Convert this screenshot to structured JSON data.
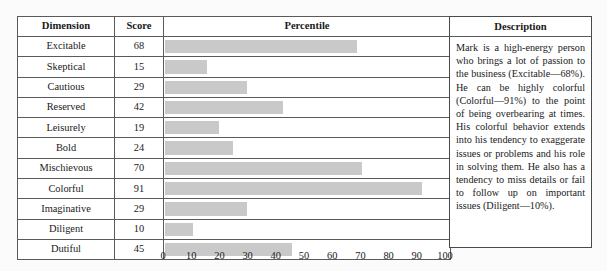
{
  "table": {
    "headers": {
      "dimension": "Dimension",
      "score": "Score",
      "percentile": "Percentile",
      "description": "Description"
    },
    "rows": [
      {
        "dimension": "Excitable",
        "score": 68
      },
      {
        "dimension": "Skeptical",
        "score": 15
      },
      {
        "dimension": "Cautious",
        "score": 29
      },
      {
        "dimension": "Reserved",
        "score": 42
      },
      {
        "dimension": "Leisurely",
        "score": 19
      },
      {
        "dimension": "Bold",
        "score": 24
      },
      {
        "dimension": "Mischievous",
        "score": 70
      },
      {
        "dimension": "Colorful",
        "score": 91
      },
      {
        "dimension": "Imaginative",
        "score": 29
      },
      {
        "dimension": "Diligent",
        "score": 10
      },
      {
        "dimension": "Dutiful",
        "score": 45
      }
    ]
  },
  "description": {
    "text": "Mark is a high-energy person who brings a lot of passion to the business (Excitable—68%). He can be highly colorful (Colorful—91%) to the point of being overbearing at times. His colorful behavior extends into his tendency to exaggerate issues or problems and his role in solving them. He also has a tendency to miss details or fail to follow up on important issues (Diligent—10%)."
  },
  "axis": {
    "ticks": [
      "0",
      "10",
      "20",
      "30",
      "40",
      "50",
      "60",
      "70",
      "80",
      "90",
      "100"
    ],
    "min": 0,
    "max": 100
  },
  "colors": {
    "bar": "#c9c9c9",
    "border": "#4a4a4a",
    "background": "#fbfbfb"
  },
  "chart_data": {
    "type": "bar",
    "orientation": "horizontal",
    "title": "",
    "xlabel": "Percentile",
    "ylabel": "Dimension",
    "categories": [
      "Excitable",
      "Skeptical",
      "Cautious",
      "Reserved",
      "Leisurely",
      "Bold",
      "Mischievous",
      "Colorful",
      "Imaginative",
      "Diligent",
      "Dutiful"
    ],
    "values": [
      68,
      15,
      29,
      42,
      19,
      24,
      70,
      91,
      29,
      10,
      45
    ],
    "xlim": [
      0,
      100
    ],
    "xticks": [
      0,
      10,
      20,
      30,
      40,
      50,
      60,
      70,
      80,
      90,
      100
    ],
    "grid": false,
    "legend": null
  }
}
